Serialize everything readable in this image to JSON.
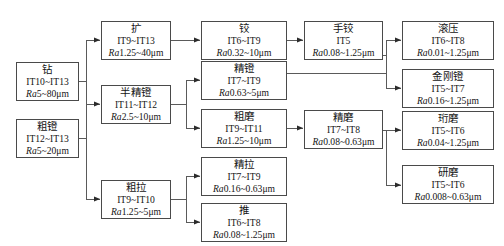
{
  "diagram": {
    "type": "process-flow",
    "legend": {
      "tolerance_prefix": "IT",
      "roughness_prefix": "Ra",
      "unit": "μm"
    },
    "nodes": [
      {
        "id": "zuan",
        "name": "钻",
        "it": "IT10~IT13",
        "ra_label": "Ra",
        "ra": "5~80μm",
        "col": 0
      },
      {
        "id": "cutang",
        "name": "粗镫",
        "it": "IT12~IT13",
        "ra_label": "Ra",
        "ra": "5~20μm",
        "col": 0
      },
      {
        "id": "kuo",
        "name": "扩",
        "it": "IT9~IT13",
        "ra_label": "Ra",
        "ra": "1.25~40μm",
        "col": 1
      },
      {
        "id": "banjingtang",
        "name": "半精镫",
        "it": "IT11~IT12",
        "ra_label": "Ra",
        "ra": "2.5~10μm",
        "col": 1
      },
      {
        "id": "cula",
        "name": "粗拉",
        "it": "IT9~IT10",
        "ra_label": "Ra",
        "ra": "1.25~5μm",
        "col": 1
      },
      {
        "id": "jiao",
        "name": "铰",
        "it": "IT6~IT9",
        "ra_label": "Ra",
        "ra": "0.32~10μm",
        "col": 2
      },
      {
        "id": "jingtang",
        "name": "精镫",
        "it": "IT7~IT9",
        "ra_label": "Ra",
        "ra": "0.63~5μm",
        "col": 2
      },
      {
        "id": "cumo",
        "name": "粗磨",
        "it": "IT9~IT11",
        "ra_label": "Ra",
        "ra": "1.25~10μm",
        "col": 2
      },
      {
        "id": "jingla",
        "name": "精拉",
        "it": "IT7~IT9",
        "ra_label": "Ra",
        "ra": "0.16~0.63μm",
        "col": 2
      },
      {
        "id": "tui",
        "name": "推",
        "it": "IT6~IT8",
        "ra_label": "Ra",
        "ra": "0.08~1.25μm",
        "col": 2
      },
      {
        "id": "shoujiao",
        "name": "手铰",
        "it": "IT5",
        "ra_label": "Ra",
        "ra": "0.08~1.25μm",
        "col": 3
      },
      {
        "id": "jingmo",
        "name": "精磨",
        "it": "IT7~IT8",
        "ra_label": "Ra",
        "ra": "0.08~0.63μm",
        "col": 3
      },
      {
        "id": "gunya",
        "name": "滚压",
        "it": "IT6~IT8",
        "ra_label": "Ra",
        "ra": "0.01~1.25μm",
        "col": 4
      },
      {
        "id": "jingangtang",
        "name": "金刚镫",
        "it": "IT5~IT7",
        "ra_label": "Ra",
        "ra": "0.16~1.25μm",
        "col": 4
      },
      {
        "id": "hengmo",
        "name": "珩磨",
        "it": "IT5~IT6",
        "ra_label": "Ra",
        "ra": "0.04~1.25μm",
        "col": 4
      },
      {
        "id": "yanmo",
        "name": "研磨",
        "it": "IT5~IT6",
        "ra_label": "Ra",
        "ra": "0.008~0.63μm",
        "col": 4
      }
    ],
    "edges": [
      {
        "from": "zuan",
        "to": "kuo"
      },
      {
        "from": "zuan",
        "to": "banjingtang"
      },
      {
        "from": "zuan",
        "to": "cula"
      },
      {
        "from": "cutang",
        "to": "kuo"
      },
      {
        "from": "cutang",
        "to": "banjingtang"
      },
      {
        "from": "cutang",
        "to": "cula"
      },
      {
        "from": "kuo",
        "to": "jiao"
      },
      {
        "from": "banjingtang",
        "to": "jingtang"
      },
      {
        "from": "banjingtang",
        "to": "cumo"
      },
      {
        "from": "cula",
        "to": "jingla"
      },
      {
        "from": "cula",
        "to": "tui"
      },
      {
        "from": "jiao",
        "to": "shoujiao"
      },
      {
        "from": "cumo",
        "to": "jingmo"
      },
      {
        "from": "shoujiao",
        "to": "gunya"
      },
      {
        "from": "shoujiao",
        "to": "jingangtang"
      },
      {
        "from": "jingtang",
        "to": "gunya"
      },
      {
        "from": "jingtang",
        "to": "jingangtang"
      },
      {
        "from": "jingmo",
        "to": "hengmo"
      },
      {
        "from": "jingmo",
        "to": "yanmo"
      }
    ]
  }
}
